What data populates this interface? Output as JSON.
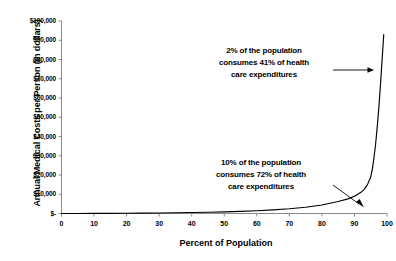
{
  "chart_data": {
    "type": "line",
    "title": "",
    "subtitle": "",
    "xlabel": "Percent of Population",
    "ylabel": "Annual Medical Costs per Person (in dollars)",
    "xlim": [
      0,
      100
    ],
    "ylim": [
      0,
      100000
    ],
    "grid": false,
    "legend": "none",
    "x_ticks": [
      0,
      10,
      20,
      30,
      40,
      50,
      60,
      70,
      80,
      90,
      100
    ],
    "x_tick_labels": [
      "0",
      "10",
      "20",
      "30",
      "40",
      "50",
      "60",
      "70",
      "80",
      "90",
      "100"
    ],
    "y_ticks": [
      0,
      10000,
      20000,
      30000,
      40000,
      50000,
      60000,
      70000,
      80000,
      90000,
      100000
    ],
    "y_tick_labels": [
      "$-",
      "$10,000",
      "$20,000",
      "$30,000",
      "$40,000",
      "$50,000",
      "$60,000",
      "$70,000",
      "$80,000",
      "$90,000",
      "$100,000"
    ],
    "series": [
      {
        "name": "Annual medical costs per person",
        "color": "#000000",
        "x": [
          0,
          5,
          10,
          15,
          20,
          25,
          30,
          35,
          40,
          45,
          50,
          55,
          60,
          65,
          70,
          75,
          80,
          85,
          88,
          90,
          92,
          93,
          94,
          95,
          95.5,
          96,
          96.5,
          97,
          97.5,
          98,
          98.5,
          99
        ],
        "y": [
          0,
          20,
          50,
          90,
          140,
          200,
          280,
          380,
          500,
          660,
          860,
          1120,
          1450,
          1880,
          2450,
          3250,
          4400,
          6200,
          7600,
          9000,
          11000,
          12500,
          15000,
          19000,
          23000,
          29000,
          36000,
          45000,
          55000,
          67000,
          80000,
          93000
        ]
      }
    ],
    "annotations": [
      {
        "id": "annotation-top",
        "lines": [
          "2% of the population",
          "consumes 41% of health",
          "care  expenditures"
        ],
        "arrow": "horizontal-right",
        "points_to_x": 98,
        "points_to_y": 62000
      },
      {
        "id": "annotation-bottom",
        "lines": [
          "10% of the population",
          "consumes 72% of health",
          "care  expenditures"
        ],
        "arrow": "diagonal-down-right",
        "points_to_x": 94,
        "points_to_y": 3000
      }
    ]
  },
  "axis": {
    "y_title": "Annual Medical Costs per Person (in dollars)",
    "x_title": "Percent of Population"
  },
  "annotations": {
    "top": {
      "line1": "2% of the population",
      "line2": "consumes 41% of health",
      "line3": "care  expenditures"
    },
    "bottom": {
      "line1": "10% of the population",
      "line2": "consumes 72% of health",
      "line3": "care  expenditures"
    }
  },
  "colors": {
    "background": "#ffffff",
    "axis": "#808080",
    "curve": "#000000",
    "text": "#000000"
  }
}
